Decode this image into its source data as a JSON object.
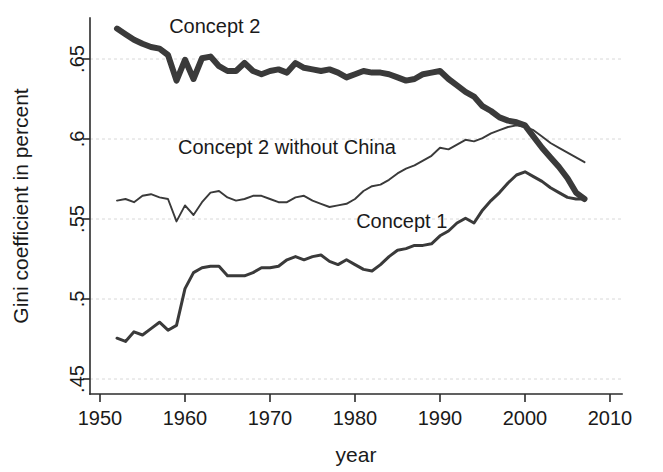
{
  "chart_data": {
    "type": "line",
    "title": "",
    "xlabel": "year",
    "ylabel": "Gini coefficient in percent",
    "xlim": [
      1950,
      2010
    ],
    "ylim": [
      0.45,
      0.675
    ],
    "grid": true,
    "legend_position": "inline-annotations",
    "xticks": [
      1950,
      1960,
      1970,
      1980,
      1990,
      2000,
      2010
    ],
    "xtick_labels": [
      "1950",
      "1960",
      "1970",
      "1980",
      "1990",
      "2000",
      "2010"
    ],
    "yticks": [
      0.45,
      0.5,
      0.55,
      0.6,
      0.65
    ],
    "ytick_labels": [
      ".45",
      ".5",
      ".55",
      ".6",
      ".65"
    ],
    "annotations": [
      {
        "text": "Concept 2",
        "x": 1963.5,
        "y": 0.6665
      },
      {
        "text": "Concept 2 without China",
        "x": 1972.0,
        "y": 0.5905
      },
      {
        "text": "Concept 1",
        "x": 1985.5,
        "y": 0.5445
      }
    ],
    "series": [
      {
        "name": "Concept 2",
        "stroke_width": 6,
        "color": "#3a3a3a",
        "x": [
          1952,
          1953,
          1954,
          1955,
          1956,
          1957,
          1958,
          1959,
          1960,
          1961,
          1962,
          1963,
          1964,
          1965,
          1966,
          1967,
          1968,
          1969,
          1970,
          1971,
          1972,
          1973,
          1974,
          1975,
          1976,
          1977,
          1978,
          1979,
          1980,
          1981,
          1982,
          1983,
          1984,
          1985,
          1986,
          1987,
          1988,
          1989,
          1990,
          1991,
          1992,
          1993,
          1994,
          1995,
          1996,
          1997,
          1998,
          1999,
          2000,
          2001,
          2002,
          2003,
          2004,
          2005,
          2006,
          2007
        ],
        "values": [
          0.669,
          0.6655,
          0.662,
          0.6595,
          0.6575,
          0.6565,
          0.6525,
          0.6365,
          0.6495,
          0.6375,
          0.6505,
          0.6515,
          0.6455,
          0.6425,
          0.6425,
          0.6475,
          0.6425,
          0.6405,
          0.6425,
          0.6435,
          0.6415,
          0.6475,
          0.6445,
          0.6435,
          0.6425,
          0.6435,
          0.6415,
          0.6385,
          0.6405,
          0.6425,
          0.6415,
          0.6415,
          0.6405,
          0.6385,
          0.6365,
          0.6375,
          0.6405,
          0.6415,
          0.6425,
          0.6375,
          0.6335,
          0.6295,
          0.6265,
          0.6205,
          0.6175,
          0.6135,
          0.6115,
          0.6105,
          0.6085,
          0.6015,
          0.5945,
          0.5885,
          0.5825,
          0.5755,
          0.5665,
          0.5625
        ]
      },
      {
        "name": "Concept 2 without China",
        "stroke_width": 1.9,
        "color": "#3a3a3a",
        "x": [
          1952,
          1953,
          1954,
          1955,
          1956,
          1957,
          1958,
          1959,
          1960,
          1961,
          1962,
          1963,
          1964,
          1965,
          1966,
          1967,
          1968,
          1969,
          1970,
          1971,
          1972,
          1973,
          1974,
          1975,
          1976,
          1977,
          1978,
          1979,
          1980,
          1981,
          1982,
          1983,
          1984,
          1985,
          1986,
          1987,
          1988,
          1989,
          1990,
          1991,
          1992,
          1993,
          1994,
          1995,
          1996,
          1997,
          1998,
          1999,
          2000,
          2001,
          2002,
          2003,
          2004,
          2005,
          2006,
          2007
        ],
        "values": [
          0.5615,
          0.5625,
          0.5605,
          0.5645,
          0.5655,
          0.5635,
          0.5625,
          0.5485,
          0.5585,
          0.5525,
          0.5605,
          0.5665,
          0.5675,
          0.5635,
          0.5615,
          0.5625,
          0.5645,
          0.5645,
          0.5625,
          0.5605,
          0.5605,
          0.5635,
          0.5645,
          0.5615,
          0.5595,
          0.5575,
          0.5585,
          0.5595,
          0.5625,
          0.5675,
          0.5705,
          0.5715,
          0.5745,
          0.5785,
          0.5815,
          0.5835,
          0.5865,
          0.5895,
          0.5945,
          0.5935,
          0.5965,
          0.5995,
          0.5985,
          0.6005,
          0.6035,
          0.6055,
          0.6075,
          0.6085,
          0.6075,
          0.6055,
          0.6015,
          0.5975,
          0.5945,
          0.5915,
          0.5885,
          0.5855
        ]
      },
      {
        "name": "Concept 1",
        "stroke_width": 3,
        "color": "#3a3a3a",
        "x": [
          1952,
          1953,
          1954,
          1955,
          1956,
          1957,
          1958,
          1959,
          1960,
          1961,
          1962,
          1963,
          1964,
          1965,
          1966,
          1967,
          1968,
          1969,
          1970,
          1971,
          1972,
          1973,
          1974,
          1975,
          1976,
          1977,
          1978,
          1979,
          1980,
          1981,
          1982,
          1983,
          1984,
          1985,
          1986,
          1987,
          1988,
          1989,
          1990,
          1991,
          1992,
          1993,
          1994,
          1995,
          1996,
          1997,
          1998,
          1999,
          2000,
          2001,
          2002,
          2003,
          2004,
          2005,
          2006,
          2007
        ],
        "values": [
          0.4755,
          0.4735,
          0.4795,
          0.4775,
          0.4815,
          0.4855,
          0.4805,
          0.4835,
          0.5065,
          0.5165,
          0.5195,
          0.5205,
          0.5205,
          0.5145,
          0.5145,
          0.5145,
          0.5165,
          0.5195,
          0.5195,
          0.5205,
          0.5245,
          0.5265,
          0.5245,
          0.5265,
          0.5275,
          0.5235,
          0.5215,
          0.5245,
          0.5215,
          0.5185,
          0.5175,
          0.5215,
          0.5265,
          0.5305,
          0.5315,
          0.5335,
          0.5335,
          0.5345,
          0.5395,
          0.5425,
          0.5475,
          0.5505,
          0.5475,
          0.5555,
          0.5615,
          0.5665,
          0.5725,
          0.5775,
          0.5795,
          0.5765,
          0.5735,
          0.5695,
          0.5665,
          0.5635,
          0.5625,
          0.5625
        ]
      }
    ]
  }
}
